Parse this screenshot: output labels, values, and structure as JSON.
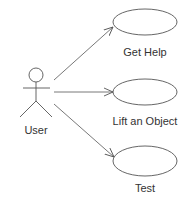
{
  "diagram": {
    "type": "uml-use-case",
    "actor": {
      "label": "User"
    },
    "use_cases": [
      {
        "label": "Get Help"
      },
      {
        "label": "Lift an Object"
      },
      {
        "label": "Test"
      }
    ],
    "colors": {
      "stroke": "#555555",
      "text": "#333333",
      "background": "#ffffff"
    }
  }
}
